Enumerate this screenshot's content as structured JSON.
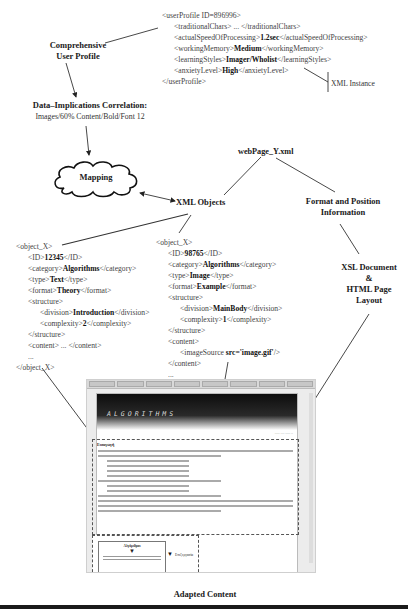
{
  "labels": {
    "comprehensive_profile": [
      "Comprehensive",
      "User Profile"
    ],
    "correlation_title": "Data–Implications Correlation:",
    "correlation_value": "Images/60% Content/Bold/Font 12",
    "mapping": "Mapping",
    "xml_instance": "XML Instance",
    "web_page": "webPage_Y.xml",
    "xml_objects": "XML Objects",
    "format_position": [
      "Format and Position",
      "Information"
    ],
    "xsl_document": [
      "XSL Document",
      "&",
      "HTML Page",
      "Layout"
    ],
    "adapted_content": "Adapted Content"
  },
  "user_profile": {
    "open": "<userProfile ID=896996>",
    "lines": [
      {
        "pre": "<traditionalChars> ... </traditionalChars>",
        "val": "",
        "post": ""
      },
      {
        "pre": "<actualSpeedOfProcessing>",
        "val": "1.2sec",
        "post": "</actualSpeedOfProcessing>"
      },
      {
        "pre": "<workingMemory>",
        "val": "Medium",
        "post": "</workingMemory>"
      },
      {
        "pre": "<learningStyles>",
        "val": "Imager/Wholist",
        "post": "</learningStyles>"
      },
      {
        "pre": "<anxietyLevel>",
        "val": "High",
        "post": "</anxietyLevel>"
      }
    ],
    "close": "</userProfile>"
  },
  "object_x": {
    "open": "<object_X>",
    "id": {
      "pre": "<ID>",
      "val": "12345",
      "post": "</ID>"
    },
    "category": {
      "pre": "<category>",
      "val": "Algorithms",
      "post": "</category>"
    },
    "type": {
      "pre": "<type>",
      "val": "Text",
      "post": "</type>"
    },
    "format": {
      "pre": "<format>",
      "val": "Theory",
      "post": "</format>"
    },
    "structure_open": "<structure>",
    "division": {
      "pre": "<division>",
      "val": "Introduction",
      "post": "</division>"
    },
    "complexity": {
      "pre": "<complexity>",
      "val": "2",
      "post": "</complexity>"
    },
    "structure_close": "</structure>",
    "content": "<content> ... </content>",
    "ellipsis": "...",
    "close": "</object_X>"
  },
  "object_y": {
    "open": "<object_X>",
    "id": {
      "pre": "<ID>",
      "val": "98765",
      "post": "</ID>"
    },
    "category": {
      "pre": "<category>",
      "val": "Algorithms",
      "post": "</category>"
    },
    "type": {
      "pre": "<type>",
      "val": "Image",
      "post": "</type>"
    },
    "format": {
      "pre": "<format>",
      "val": "Example",
      "post": "</format>"
    },
    "structure_open": "<structure>",
    "division": {
      "pre": "<division>",
      "val": "MainBody",
      "post": "</division>"
    },
    "complexity": {
      "pre": "<complexity>",
      "val": "1",
      "post": "</complexity>"
    },
    "structure_close": "</structure>",
    "content_open": "<content>",
    "image_source": {
      "pre": "<imageSource ",
      "val": "src='image.gif'",
      "post": "/>"
    },
    "content_close": "</content>",
    "ellipsis": "...",
    "close": "</object_Y>"
  },
  "screenshot": {
    "banner_title": "ALGORITHMS",
    "section_heading": "Εισαγωγή",
    "box_title": "Αλγόριθμοι",
    "box_next": "Επεξεργασία"
  }
}
